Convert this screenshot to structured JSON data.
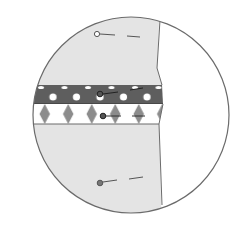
{
  "diagram": {
    "type": "sewing-detail-magnifier",
    "colors": {
      "background": "#ffffff",
      "circle_outline": "#6b6b6b",
      "fabric": "#e4e4e4",
      "dark_band": "#5e5e5e",
      "light_band": "#ffffff",
      "diamond_pattern": "#8c8c8c",
      "pin": "#555555"
    },
    "elements": {
      "fabric_panel": "light grey fabric panel",
      "dark_trim_band": "dark polka-dot trim strip",
      "light_trim_band": "white trim strip with diamond/argyle pattern",
      "pins": [
        {
          "label": "pin-top",
          "x": 97,
          "y": 34
        },
        {
          "label": "pin-dark-band",
          "x": 100,
          "y": 94
        },
        {
          "label": "pin-light-band",
          "x": 103,
          "y": 116
        },
        {
          "label": "pin-bottom",
          "x": 100,
          "y": 183
        }
      ]
    }
  }
}
